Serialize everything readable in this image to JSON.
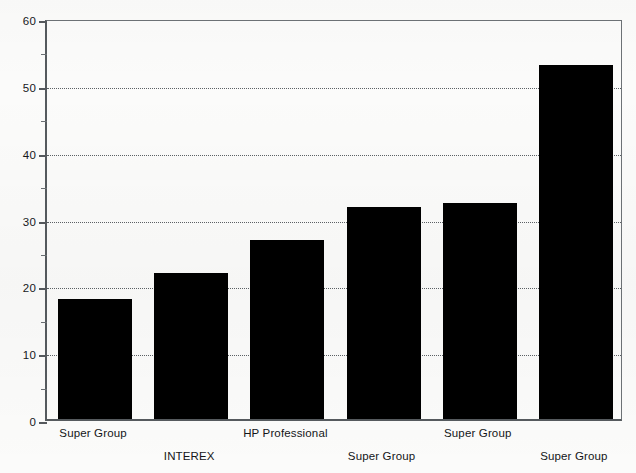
{
  "chart_data": {
    "type": "bar",
    "title": "",
    "subtitle": "",
    "xlabel": "",
    "ylabel": "",
    "ylim": [
      0,
      60
    ],
    "grid": true,
    "legend": "none",
    "y_ticks": [
      0,
      10,
      20,
      30,
      40,
      50,
      60
    ],
    "y_tick_labels": [
      "0",
      "10",
      "20",
      "30",
      "40",
      "50",
      "60"
    ],
    "y_minor_ticks": [
      5,
      15,
      25,
      35,
      45,
      55
    ],
    "categories": [
      "Super Group",
      "INTEREX",
      "HP Professional",
      "Super Group",
      "Super Group",
      "Super Group"
    ],
    "values": [
      18.0,
      21.8,
      26.8,
      31.7,
      32.3,
      53.0
    ],
    "bar_color": "#000000",
    "label_rows": [
      0,
      1,
      0,
      1,
      0,
      1
    ]
  }
}
